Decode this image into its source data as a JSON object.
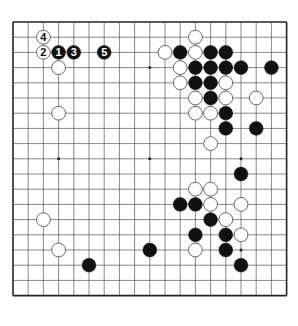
{
  "diagram": {
    "type": "go-board",
    "size": 19,
    "star_points": [
      [
        3,
        3
      ],
      [
        9,
        3
      ],
      [
        15,
        3
      ],
      [
        3,
        9
      ],
      [
        9,
        9
      ],
      [
        15,
        9
      ],
      [
        3,
        15
      ],
      [
        9,
        15
      ],
      [
        15,
        15
      ]
    ],
    "colors": {
      "black": "#111111",
      "white": "#ffffff",
      "line": "#555555",
      "edge": "#222222"
    },
    "stones": [
      {
        "color": "white",
        "col": 2,
        "row": 1,
        "label": "4"
      },
      {
        "color": "white",
        "col": 2,
        "row": 2,
        "label": "2"
      },
      {
        "color": "black",
        "col": 3,
        "row": 2,
        "label": "1"
      },
      {
        "color": "black",
        "col": 4,
        "row": 2,
        "label": "3"
      },
      {
        "color": "black",
        "col": 6,
        "row": 2,
        "label": "5"
      },
      {
        "color": "white",
        "col": 3,
        "row": 3,
        "label": ""
      },
      {
        "color": "white",
        "col": 3,
        "row": 6,
        "label": ""
      },
      {
        "color": "white",
        "col": 12,
        "row": 1,
        "label": ""
      },
      {
        "color": "white",
        "col": 10,
        "row": 2,
        "label": ""
      },
      {
        "color": "black",
        "col": 11,
        "row": 2,
        "label": ""
      },
      {
        "color": "white",
        "col": 12,
        "row": 2,
        "label": ""
      },
      {
        "color": "black",
        "col": 13,
        "row": 2,
        "label": ""
      },
      {
        "color": "black",
        "col": 14,
        "row": 2,
        "label": ""
      },
      {
        "color": "white",
        "col": 11,
        "row": 3,
        "label": ""
      },
      {
        "color": "black",
        "col": 12,
        "row": 3,
        "label": ""
      },
      {
        "color": "black",
        "col": 13,
        "row": 3,
        "label": ""
      },
      {
        "color": "black",
        "col": 14,
        "row": 3,
        "label": ""
      },
      {
        "color": "black",
        "col": 15,
        "row": 3,
        "label": ""
      },
      {
        "color": "black",
        "col": 17,
        "row": 3,
        "label": ""
      },
      {
        "color": "white",
        "col": 11,
        "row": 4,
        "label": ""
      },
      {
        "color": "black",
        "col": 12,
        "row": 4,
        "label": ""
      },
      {
        "color": "black",
        "col": 13,
        "row": 4,
        "label": ""
      },
      {
        "color": "white",
        "col": 14,
        "row": 4,
        "label": ""
      },
      {
        "color": "white",
        "col": 12,
        "row": 5,
        "label": ""
      },
      {
        "color": "black",
        "col": 13,
        "row": 5,
        "label": ""
      },
      {
        "color": "white",
        "col": 14,
        "row": 5,
        "label": ""
      },
      {
        "color": "white",
        "col": 16,
        "row": 5,
        "label": ""
      },
      {
        "color": "white",
        "col": 12,
        "row": 6,
        "label": ""
      },
      {
        "color": "white",
        "col": 13,
        "row": 6,
        "label": ""
      },
      {
        "color": "black",
        "col": 14,
        "row": 6,
        "label": ""
      },
      {
        "color": "black",
        "col": 14,
        "row": 7,
        "label": ""
      },
      {
        "color": "black",
        "col": 16,
        "row": 7,
        "label": ""
      },
      {
        "color": "white",
        "col": 13,
        "row": 8,
        "label": ""
      },
      {
        "color": "black",
        "col": 15,
        "row": 10,
        "label": ""
      },
      {
        "color": "white",
        "col": 12,
        "row": 11,
        "label": ""
      },
      {
        "color": "white",
        "col": 13,
        "row": 11,
        "label": ""
      },
      {
        "color": "black",
        "col": 11,
        "row": 12,
        "label": ""
      },
      {
        "color": "black",
        "col": 12,
        "row": 12,
        "label": ""
      },
      {
        "color": "white",
        "col": 13,
        "row": 12,
        "label": ""
      },
      {
        "color": "white",
        "col": 15,
        "row": 12,
        "label": ""
      },
      {
        "color": "black",
        "col": 13,
        "row": 13,
        "label": ""
      },
      {
        "color": "white",
        "col": 14,
        "row": 13,
        "label": ""
      },
      {
        "color": "white",
        "col": 2,
        "row": 13,
        "label": ""
      },
      {
        "color": "black",
        "col": 12,
        "row": 14,
        "label": ""
      },
      {
        "color": "black",
        "col": 14,
        "row": 14,
        "label": ""
      },
      {
        "color": "white",
        "col": 15,
        "row": 14,
        "label": ""
      },
      {
        "color": "white",
        "col": 3,
        "row": 15,
        "label": ""
      },
      {
        "color": "black",
        "col": 9,
        "row": 15,
        "label": ""
      },
      {
        "color": "white",
        "col": 12,
        "row": 15,
        "label": ""
      },
      {
        "color": "black",
        "col": 14,
        "row": 15,
        "label": ""
      },
      {
        "color": "black",
        "col": 5,
        "row": 16,
        "label": ""
      },
      {
        "color": "black",
        "col": 15,
        "row": 16,
        "label": ""
      }
    ]
  }
}
